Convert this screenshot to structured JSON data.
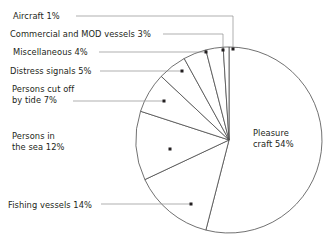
{
  "chart_data": {
    "type": "pie",
    "title": "",
    "subtitle": "",
    "xlabel": "",
    "ylabel": "",
    "legend_position": "none",
    "grid": false,
    "units": "percent",
    "total": 100,
    "start_angle_deg": 0,
    "direction": "clockwise",
    "categories": [
      "Pleasure craft",
      "Fishing vessels",
      "Persons in the sea",
      "Persons cut off by tide",
      "Distress signals",
      "Miscellaneous",
      "Commercial and MOD vessels",
      "Aircraft"
    ],
    "values": [
      54,
      14,
      12,
      7,
      5,
      4,
      3,
      1
    ],
    "slices": [
      {
        "id": "pleasure-craft",
        "category": "Pleasure craft",
        "value": 54,
        "label": "Pleasure craft 54%",
        "label_lines": [
          "Pleasure",
          "craft 54%"
        ],
        "label_placement": "inside",
        "label_x": 253,
        "label_y": 136,
        "leader": false
      },
      {
        "id": "fishing-vessels",
        "category": "Fishing vessels",
        "value": 14,
        "label": "Fishing vessels 14%",
        "label_lines": [
          "Fishing vessels 14%"
        ],
        "label_placement": "outside-left",
        "label_x": 8,
        "label_y": 208,
        "leader": true,
        "leader_path": "M 101 204 L 191 204",
        "dot_x": 191,
        "dot_y": 204
      },
      {
        "id": "persons-in-the-sea",
        "category": "Persons in the sea",
        "value": 12,
        "label": "Persons in the sea 12%",
        "label_lines": [
          "Persons in",
          "the sea 12%"
        ],
        "label_placement": "outside-left",
        "label_x": 12,
        "label_y": 139,
        "leader": false,
        "dot_x": 170,
        "dot_y": 149
      },
      {
        "id": "persons-cut-off-by-tide",
        "category": "Persons cut off by tide",
        "value": 7,
        "label": "Persons cut off by tide 7%",
        "label_lines": [
          "Persons cut off",
          "by tide 7%"
        ],
        "label_placement": "outside-left",
        "label_x": 12,
        "label_y": 92,
        "leader": true,
        "leader_path": "M 73 101 L 164 101",
        "dot_x": 164,
        "dot_y": 101
      },
      {
        "id": "distress-signals",
        "category": "Distress signals",
        "value": 5,
        "label": "Distress signals 5%",
        "label_lines": [
          "Distress signals 5%"
        ],
        "label_placement": "outside-left",
        "label_x": 10,
        "label_y": 74,
        "leader": true,
        "leader_path": "M 100 71 L 182 71",
        "dot_x": 182,
        "dot_y": 71
      },
      {
        "id": "miscellaneous",
        "category": "Miscellaneous",
        "value": 4,
        "label": "Miscellaneous 4%",
        "label_lines": [
          "Miscellaneous 4%"
        ],
        "label_placement": "outside-left",
        "label_x": 13,
        "label_y": 55,
        "leader": true,
        "leader_path": "M 99 52 L 206 52",
        "dot_x": 206,
        "dot_y": 52
      },
      {
        "id": "commercial-and-mod-vessels",
        "category": "Commercial and MOD vessels",
        "value": 3,
        "label": "Commercial and MOD vessels 3%",
        "label_lines": [
          "Commercial and MOD vessels 3%"
        ],
        "label_placement": "outside-left",
        "label_x": 10,
        "label_y": 37,
        "leader": true,
        "leader_path": "M 163 34 L 223 34 L 223 49",
        "dot_x": 223,
        "dot_y": 50
      },
      {
        "id": "aircraft",
        "category": "Aircraft",
        "value": 1,
        "label": "Aircraft 1%",
        "label_lines": [
          "Aircraft 1%"
        ],
        "label_placement": "outside-left",
        "label_x": 13,
        "label_y": 19,
        "leader": true,
        "leader_path": "M 76 16 L 233 16 L 233 48",
        "dot_x": 233,
        "dot_y": 49
      }
    ],
    "geometry": {
      "center_x": 229,
      "center_y": 140,
      "radius": 93
    },
    "colors": {
      "background": "#ffffff",
      "slice_fill": "#ffffff",
      "slice_stroke": "#4d4d4d",
      "leader": "#8c8c8c",
      "text": "#231f20",
      "dot": "#231f20"
    }
  }
}
